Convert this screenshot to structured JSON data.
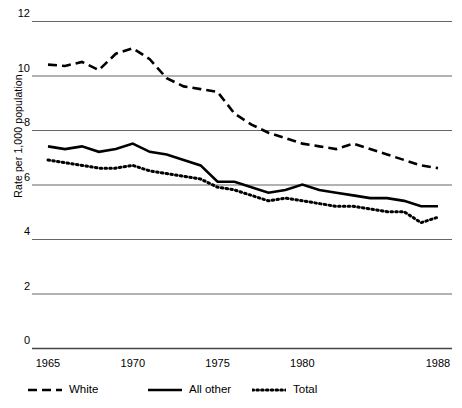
{
  "chart_data": {
    "type": "line",
    "title": "",
    "xlabel": "",
    "ylabel": "Rate per 1,000 population",
    "ylim": [
      0,
      12
    ],
    "xlim": [
      1965,
      1988
    ],
    "grid": true,
    "grid_axis": "y",
    "legend_position": "bottom",
    "ytick_labels": [
      "12",
      "10",
      "8",
      "6",
      "4",
      "2",
      "0"
    ],
    "ytick_values": [
      12,
      10,
      8,
      6,
      4,
      2,
      0
    ],
    "xtick_labels": [
      "1965",
      "1970",
      "1975",
      "1980",
      "1988"
    ],
    "xtick_values": [
      1965,
      1970,
      1975,
      1980,
      1988
    ],
    "x": [
      1965,
      1966,
      1967,
      1968,
      1969,
      1970,
      1971,
      1972,
      1973,
      1974,
      1975,
      1976,
      1977,
      1978,
      1979,
      1980,
      1981,
      1982,
      1983,
      1984,
      1985,
      1986,
      1987,
      1988
    ],
    "series": [
      {
        "name": "White",
        "style": "dashed",
        "color": "#000000",
        "values": [
          10.4,
          10.35,
          10.5,
          10.2,
          10.8,
          11.0,
          10.6,
          9.9,
          9.6,
          9.5,
          9.4,
          8.6,
          8.2,
          7.9,
          7.7,
          7.5,
          7.4,
          7.3,
          7.5,
          7.3,
          7.1,
          6.9,
          6.7,
          6.6
        ]
      },
      {
        "name": "All other",
        "style": "solid",
        "color": "#000000",
        "values": [
          7.4,
          7.3,
          7.4,
          7.2,
          7.3,
          7.5,
          7.2,
          7.1,
          6.9,
          6.7,
          6.1,
          6.1,
          5.9,
          5.7,
          5.8,
          6.0,
          5.8,
          5.7,
          5.6,
          5.5,
          5.5,
          5.4,
          5.2,
          5.2
        ]
      },
      {
        "name": "Total",
        "style": "dotted",
        "color": "#000000",
        "values": [
          6.9,
          6.8,
          6.7,
          6.6,
          6.6,
          6.7,
          6.5,
          6.4,
          6.3,
          6.2,
          5.9,
          5.8,
          5.6,
          5.4,
          5.5,
          5.4,
          5.3,
          5.2,
          5.2,
          5.1,
          5.0,
          5.0,
          4.6,
          4.8
        ]
      }
    ]
  },
  "legend": {
    "items": [
      {
        "label": "White",
        "style": "dashed"
      },
      {
        "label": "All other",
        "style": "solid"
      },
      {
        "label": "Total",
        "style": "dotted"
      }
    ]
  }
}
